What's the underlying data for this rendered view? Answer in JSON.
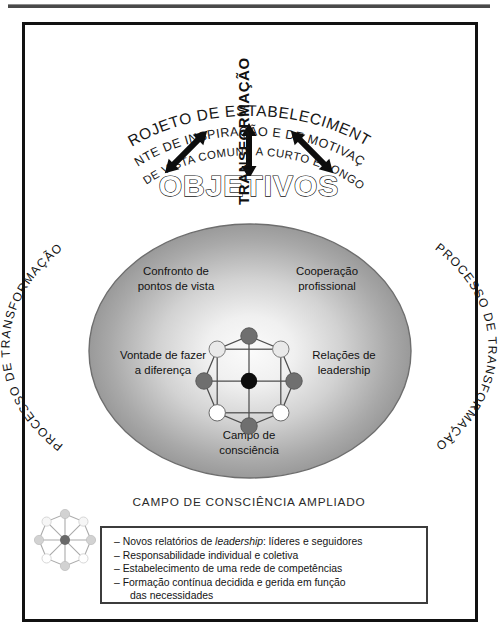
{
  "figure": {
    "title_arcs": [
      "PROJETO DE ESTABELECIMENTO",
      "FONTE DE INSPIRAÇÃO E DE MOTIVAÇÃO",
      "PONTOS DE VISTA COMUNS A CURTO E LONGO PRAZO"
    ],
    "center_heading": "OBJETIVOS",
    "vertical_label": "TRANSFORMAÇÃO",
    "left_arc_label": "PROCESSO DE TRANSFORMAÇÃO",
    "right_arc_label": "PROCESSO DE TRANSFORMAÇÃO",
    "ellipse_labels": {
      "top_left_line1": "Confronto de",
      "top_left_line2": "pontos de vista",
      "top_right_line1": "Cooperação",
      "top_right_line2": "profissional",
      "mid_left_line1": "Vontade de fazer",
      "mid_left_line2": "a diferença",
      "mid_right_line1": "Relações de",
      "mid_right_line2_italic": "leadership",
      "bottom_line1": "Campo de",
      "bottom_line2": "consciência"
    },
    "caption": "CAMPO DE CONSCIÊNCIA AMPLIADO",
    "bullets": [
      {
        "dash": "–",
        "pre": "Novos relatórios de ",
        "italic": "leadership",
        "post": ": líderes e seguidores",
        "cont": ""
      },
      {
        "dash": "–",
        "pre": "Responsabilidade individual e coletiva",
        "italic": "",
        "post": "",
        "cont": ""
      },
      {
        "dash": "–",
        "pre": "Estabelecimento de uma rede de competências",
        "italic": "",
        "post": "",
        "cont": ""
      },
      {
        "dash": "–",
        "pre": "Formação contínua decidida e gerida em função",
        "italic": "",
        "post": "",
        "cont": "das necessidades"
      }
    ],
    "icons": {
      "arrow_left": "double-arrow-diagonal-left",
      "arrow_up": "double-arrow-vertical",
      "arrow_right": "double-arrow-diagonal-right",
      "network_main": "octagon-network-icon",
      "network_legend": "octagon-network-icon-small"
    },
    "colors": {
      "frame": "#111111",
      "ellipse_edge": "#8a8a8a",
      "ellipse_center": "#f2f2f2",
      "node_dark": "#6f6f6f",
      "node_light": "#e8e8e8",
      "node_white": "#ffffff",
      "node_center": "#0d0d0d",
      "text": "#141414",
      "listbox_border": "#3c3c3c"
    },
    "network": {
      "node_count": 8,
      "center_node": 1,
      "nodes": [
        {
          "pos": "top",
          "fill": "#6f6f6f"
        },
        {
          "pos": "top-right",
          "fill": "#e8e8e8"
        },
        {
          "pos": "right",
          "fill": "#6f6f6f"
        },
        {
          "pos": "bottom-right",
          "fill": "#ffffff"
        },
        {
          "pos": "bottom",
          "fill": "#6f6f6f"
        },
        {
          "pos": "bottom-left",
          "fill": "#ffffff"
        },
        {
          "pos": "left",
          "fill": "#6f6f6f"
        },
        {
          "pos": "top-left",
          "fill": "#e8e8e8"
        }
      ]
    }
  }
}
